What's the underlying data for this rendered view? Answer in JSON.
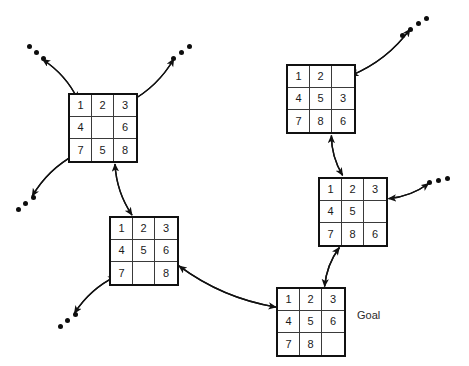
{
  "diagram": {
    "goal_label": "Goal",
    "ink_color": "#111111",
    "background_color": "#ffffff"
  },
  "states": [
    {
      "id": "state-top-left",
      "name": "puzzle-grid-top-left",
      "x": 68,
      "y": 93,
      "tiles": [
        "1",
        "2",
        "3",
        "4",
        "",
        "6",
        "7",
        "5",
        "8"
      ]
    },
    {
      "id": "state-middle-left",
      "name": "puzzle-grid-middle-left",
      "x": 109,
      "y": 216,
      "tiles": [
        "1",
        "2",
        "3",
        "4",
        "5",
        "6",
        "7",
        "",
        "8"
      ]
    },
    {
      "id": "state-top-right",
      "name": "puzzle-grid-top-right",
      "x": 286,
      "y": 64,
      "tiles": [
        "1",
        "2",
        "",
        "4",
        "5",
        "3",
        "7",
        "8",
        "6"
      ]
    },
    {
      "id": "state-middle-right",
      "name": "puzzle-grid-middle-right",
      "x": 318,
      "y": 177,
      "tiles": [
        "1",
        "2",
        "3",
        "4",
        "5",
        "",
        "7",
        "8",
        "6"
      ]
    },
    {
      "id": "state-goal",
      "name": "puzzle-grid-goal",
      "x": 276,
      "y": 287,
      "tiles": [
        "1",
        "2",
        "3",
        "4",
        "5",
        "6",
        "7",
        "8",
        ""
      ]
    }
  ],
  "ellipses": [
    {
      "name": "ellipsis-top-left",
      "dots": [
        [
          27,
          44
        ],
        [
          34,
          50
        ],
        [
          41,
          56
        ]
      ]
    },
    {
      "name": "ellipsis-top-left-right",
      "dots": [
        [
          171,
          56
        ],
        [
          179,
          50
        ],
        [
          187,
          44
        ]
      ]
    },
    {
      "name": "ellipsis-mid-left",
      "dots": [
        [
          31,
          195
        ],
        [
          23,
          201
        ],
        [
          16,
          207
        ]
      ]
    },
    {
      "name": "ellipsis-bottom-left",
      "dots": [
        [
          73,
          312
        ],
        [
          65,
          318
        ],
        [
          58,
          324
        ]
      ]
    },
    {
      "name": "ellipsis-top-right",
      "dots": [
        [
          400,
          33
        ],
        [
          408,
          27
        ],
        [
          416,
          21
        ],
        [
          424,
          16
        ]
      ]
    },
    {
      "name": "ellipsis-right",
      "dots": [
        [
          427,
          180
        ],
        [
          436,
          178
        ],
        [
          445,
          176
        ]
      ]
    }
  ],
  "edges": [
    {
      "name": "edge-top-left-to-ellipsis-out",
      "from": "state-top-left",
      "to": "ellipsis-top-left"
    },
    {
      "name": "edge-ellipsis-to-top-left-in",
      "from": "ellipsis-top-left",
      "to": "state-top-left"
    },
    {
      "name": "edge-top-left-to-ellipsis-right-out",
      "from": "state-top-left",
      "to": "ellipsis-top-left-right"
    },
    {
      "name": "edge-ellipsis-right-to-top-left-in",
      "from": "ellipsis-top-left-right",
      "to": "state-top-left"
    },
    {
      "name": "edge-top-left-to-mid-ellipsis",
      "from": "state-top-left",
      "to": "ellipsis-mid-left"
    },
    {
      "name": "edge-mid-ellipsis-to-top-left",
      "from": "ellipsis-mid-left",
      "to": "state-top-left"
    },
    {
      "name": "edge-top-left-to-middle-left",
      "from": "state-top-left",
      "to": "state-middle-left"
    },
    {
      "name": "edge-middle-left-to-top-left",
      "from": "state-middle-left",
      "to": "state-top-left"
    },
    {
      "name": "edge-middle-left-to-bottom-ellipsis",
      "from": "state-middle-left",
      "to": "ellipsis-bottom-left"
    },
    {
      "name": "edge-bottom-ellipsis-to-middle-left",
      "from": "ellipsis-bottom-left",
      "to": "state-middle-left"
    },
    {
      "name": "edge-middle-left-to-goal",
      "from": "state-middle-left",
      "to": "state-goal"
    },
    {
      "name": "edge-goal-to-middle-left",
      "from": "state-goal",
      "to": "state-middle-left"
    },
    {
      "name": "edge-top-right-to-ellipsis",
      "from": "state-top-right",
      "to": "ellipsis-top-right"
    },
    {
      "name": "edge-ellipsis-to-top-right",
      "from": "ellipsis-top-right",
      "to": "state-top-right"
    },
    {
      "name": "edge-top-right-to-middle-right",
      "from": "state-top-right",
      "to": "state-middle-right"
    },
    {
      "name": "edge-middle-right-to-top-right",
      "from": "state-middle-right",
      "to": "state-top-right"
    },
    {
      "name": "edge-middle-right-to-ellipsis",
      "from": "state-middle-right",
      "to": "ellipsis-right"
    },
    {
      "name": "edge-ellipsis-to-middle-right",
      "from": "ellipsis-right",
      "to": "state-middle-right"
    },
    {
      "name": "edge-middle-right-to-goal",
      "from": "state-middle-right",
      "to": "state-goal"
    },
    {
      "name": "edge-goal-to-middle-right",
      "from": "state-goal",
      "to": "state-middle-right"
    }
  ],
  "goal_label_pos": {
    "x": 357,
    "y": 309
  }
}
